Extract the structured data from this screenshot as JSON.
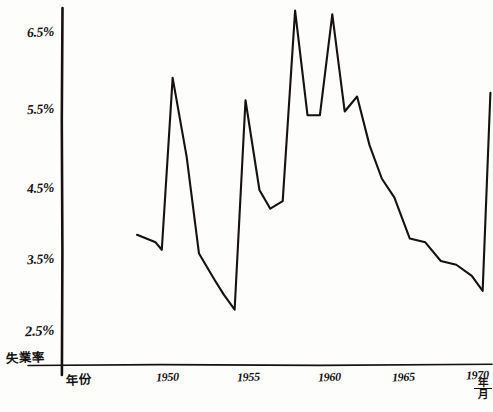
{
  "chart_data": {
    "type": "line",
    "title": "",
    "xlabel": "年份",
    "ylabel": "失業率",
    "x_unit_numerator": "年",
    "x_unit_denominator": "月",
    "grid": false,
    "legend": false,
    "ylim": [
      2.2,
      7.0
    ],
    "xlim": [
      1947.0,
      1971.0
    ],
    "yticks": [
      6.5,
      5.5,
      4.5,
      3.5,
      2.5
    ],
    "ytick_labels": [
      "6.5%",
      "5.5%",
      "4.5%",
      "3.5%",
      "2.5%"
    ],
    "xticks": [
      1950,
      1955,
      1960,
      1965,
      1970
    ],
    "xtick_labels": [
      "1950",
      "1955",
      "1960",
      "1965",
      "1970"
    ],
    "series": [
      {
        "name": "失業率",
        "x": [
          1948.0,
          1949.2,
          1949.6,
          1950.3,
          1951.2,
          1952.0,
          1953.0,
          1953.6,
          1954.3,
          1955.0,
          1955.9,
          1956.6,
          1957.4,
          1958.2,
          1959.0,
          1959.8,
          1960.6,
          1961.4,
          1962.2,
          1963.0,
          1963.8,
          1964.6,
          1965.6,
          1966.6,
          1967.6,
          1968.6,
          1969.6,
          1970.3,
          1970.8
        ],
        "y": [
          3.8,
          3.7,
          3.6,
          5.9,
          4.85,
          3.55,
          3.2,
          3.0,
          2.8,
          5.6,
          4.4,
          4.15,
          4.25,
          6.8,
          5.4,
          5.4,
          6.75,
          5.45,
          5.65,
          5.0,
          4.55,
          4.3,
          3.75,
          3.7,
          3.45,
          3.4,
          3.25,
          3.05,
          5.7
        ]
      }
    ]
  },
  "axes": {
    "y_label_text": "失業率",
    "x_label_text": "年份"
  }
}
